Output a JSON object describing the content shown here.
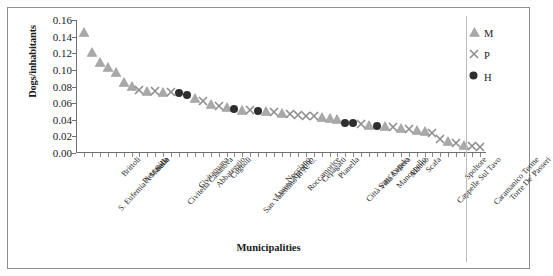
{
  "chart_data": {
    "type": "scatter",
    "title": "",
    "xlabel": "Municipalities",
    "ylabel": "Dogs/inhabitants",
    "ylim": [
      0.0,
      0.16
    ],
    "ytick_labels": [
      "0.16",
      "0.14",
      "0.12",
      "0.10",
      "0.08",
      "0.06",
      "0.04",
      "0.02",
      "0.00"
    ],
    "ytick_values": [
      0.16,
      0.14,
      0.12,
      0.1,
      0.08,
      0.06,
      0.04,
      0.02,
      0.0
    ],
    "grid": false,
    "legend_position": "right",
    "legend": [
      {
        "name": "M",
        "marker": "triangle",
        "color": "#a8a8a8"
      },
      {
        "name": "P",
        "marker": "x",
        "color": "#9a9a9a"
      },
      {
        "name": "H",
        "marker": "circle",
        "color": "#2b2b2b"
      }
    ],
    "categories": [
      "S. Eufemia A Maiella",
      "Brittoli",
      "Pietranico",
      "Salle",
      "Civitella Casanova",
      "Civitaquana",
      "Abbateggio",
      "Cugnoli",
      "San Valentino In A. C.",
      "Loreto Aprutino",
      "Nocciano",
      "Roccamorice",
      "Cepagatti",
      "Pianella",
      "Città Sant'Angelo",
      "Villa Celiera",
      "Manoppello",
      "Alanno",
      "Scafa",
      "Cappelle Sul Tavo",
      "Spoltore",
      "Caramanico Terme",
      "Torre De' Passeri"
    ],
    "points": [
      {
        "i": 0,
        "value": 0.146,
        "series": "M"
      },
      {
        "i": 1,
        "value": 0.121,
        "series": "M"
      },
      {
        "i": 2,
        "value": 0.109,
        "series": "M"
      },
      {
        "i": 3,
        "value": 0.103,
        "series": "M"
      },
      {
        "i": 4,
        "value": 0.097,
        "series": "M"
      },
      {
        "i": 5,
        "value": 0.086,
        "series": "M"
      },
      {
        "i": 6,
        "value": 0.081,
        "series": "M"
      },
      {
        "i": 7,
        "value": 0.076,
        "series": "P"
      },
      {
        "i": 8,
        "value": 0.075,
        "series": "M"
      },
      {
        "i": 9,
        "value": 0.074,
        "series": "P"
      },
      {
        "i": 10,
        "value": 0.073,
        "series": "M"
      },
      {
        "i": 11,
        "value": 0.073,
        "series": "P"
      },
      {
        "i": 12,
        "value": 0.072,
        "series": "H"
      },
      {
        "i": 13,
        "value": 0.07,
        "series": "H"
      },
      {
        "i": 14,
        "value": 0.066,
        "series": "M"
      },
      {
        "i": 15,
        "value": 0.062,
        "series": "P"
      },
      {
        "i": 16,
        "value": 0.059,
        "series": "M"
      },
      {
        "i": 17,
        "value": 0.057,
        "series": "P"
      },
      {
        "i": 18,
        "value": 0.055,
        "series": "M"
      },
      {
        "i": 19,
        "value": 0.053,
        "series": "H"
      },
      {
        "i": 20,
        "value": 0.052,
        "series": "M"
      },
      {
        "i": 21,
        "value": 0.052,
        "series": "P"
      },
      {
        "i": 22,
        "value": 0.051,
        "series": "H"
      },
      {
        "i": 23,
        "value": 0.05,
        "series": "M"
      },
      {
        "i": 24,
        "value": 0.049,
        "series": "P"
      },
      {
        "i": 25,
        "value": 0.048,
        "series": "M"
      },
      {
        "i": 26,
        "value": 0.047,
        "series": "P"
      },
      {
        "i": 27,
        "value": 0.046,
        "series": "P"
      },
      {
        "i": 28,
        "value": 0.045,
        "series": "P"
      },
      {
        "i": 29,
        "value": 0.044,
        "series": "P"
      },
      {
        "i": 30,
        "value": 0.043,
        "series": "M"
      },
      {
        "i": 31,
        "value": 0.042,
        "series": "M"
      },
      {
        "i": 32,
        "value": 0.041,
        "series": "M"
      },
      {
        "i": 33,
        "value": 0.036,
        "series": "H"
      },
      {
        "i": 34,
        "value": 0.036,
        "series": "H"
      },
      {
        "i": 35,
        "value": 0.035,
        "series": "P"
      },
      {
        "i": 36,
        "value": 0.034,
        "series": "M"
      },
      {
        "i": 37,
        "value": 0.033,
        "series": "H"
      },
      {
        "i": 38,
        "value": 0.032,
        "series": "M"
      },
      {
        "i": 39,
        "value": 0.031,
        "series": "P"
      },
      {
        "i": 40,
        "value": 0.03,
        "series": "M"
      },
      {
        "i": 41,
        "value": 0.029,
        "series": "P"
      },
      {
        "i": 42,
        "value": 0.028,
        "series": "M"
      },
      {
        "i": 43,
        "value": 0.026,
        "series": "M"
      },
      {
        "i": 44,
        "value": 0.024,
        "series": "P"
      },
      {
        "i": 45,
        "value": 0.017,
        "series": "P"
      },
      {
        "i": 46,
        "value": 0.014,
        "series": "M"
      },
      {
        "i": 47,
        "value": 0.012,
        "series": "P"
      },
      {
        "i": 48,
        "value": 0.01,
        "series": "M"
      },
      {
        "i": 49,
        "value": 0.008,
        "series": "P"
      },
      {
        "i": 50,
        "value": 0.007,
        "series": "P"
      }
    ]
  }
}
